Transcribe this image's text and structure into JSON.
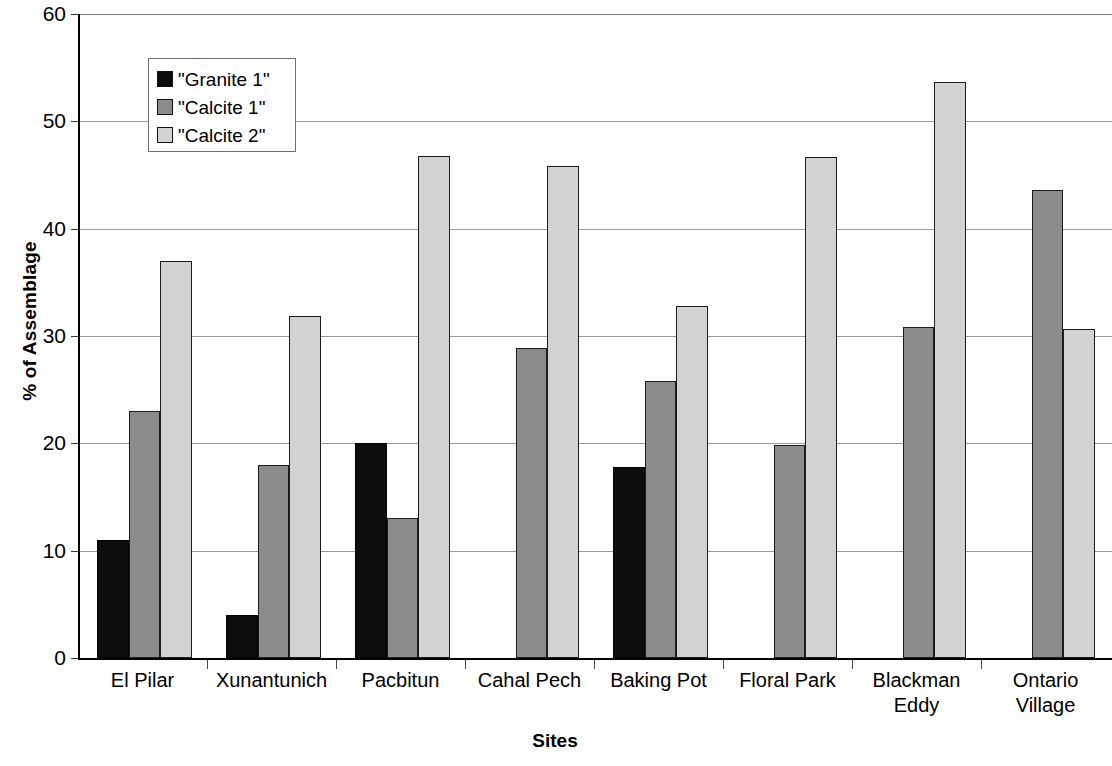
{
  "chart_data": {
    "type": "bar",
    "title": "",
    "xlabel": "Sites",
    "ylabel": "% of Assemblage",
    "ylim": [
      0,
      60
    ],
    "ytick_values": [
      0,
      10,
      20,
      30,
      40,
      50,
      60
    ],
    "ytick_labels": [
      "0",
      "10",
      "20",
      "30",
      "40",
      "50",
      "60"
    ],
    "grid": true,
    "legend_position": "upper-left-inside",
    "categories": [
      "El Pilar",
      "Xunantunich",
      "Pacbitun",
      "Cahal Pech",
      "Baking Pot",
      "Floral Park",
      "Blackman\nEddy",
      "Ontario\nVillage"
    ],
    "series": [
      {
        "name": "\"Granite 1\"",
        "color": "#0d0d0d",
        "values": [
          11.0,
          4.0,
          20.0,
          0.0,
          17.8,
          0.0,
          0.0,
          0.0
        ]
      },
      {
        "name": "\"Calcite 1\"",
        "color": "#8c8c8c",
        "values": [
          23.0,
          18.0,
          13.0,
          28.9,
          25.8,
          19.8,
          30.8,
          43.6
        ]
      },
      {
        "name": "\"Calcite 2\"",
        "color": "#d2d2d2",
        "values": [
          37.0,
          31.9,
          46.8,
          45.8,
          32.8,
          46.7,
          53.7,
          30.7
        ]
      }
    ]
  },
  "axis": {
    "y_title": "% of Assemblage",
    "x_title": "Sites"
  },
  "legend": {
    "entries": [
      {
        "label": "\"Granite 1\"",
        "color": "#0d0d0d"
      },
      {
        "label": "\"Calcite 1\"",
        "color": "#8c8c8c"
      },
      {
        "label": "\"Calcite 2\"",
        "color": "#d2d2d2"
      }
    ]
  }
}
